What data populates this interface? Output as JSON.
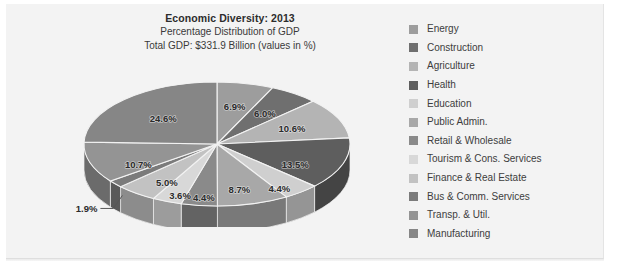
{
  "chart_data": {
    "type": "pie",
    "title": "Economic Diversity: 2013",
    "subtitle": "Percentage Distribution of GDP",
    "subtitle2": "Total GDP: $331.9 Billion (values in %)",
    "total_gdp": "$331.9 Billion",
    "year": "2013",
    "units": "%",
    "legend_position": "right",
    "grid": false,
    "categories": [
      "Energy",
      "Construction",
      "Agriculture",
      "Health",
      "Education",
      "Public Admin.",
      "Retail & Wholesale",
      "Tourism & Cons. Services",
      "Finance & Real Estate",
      "Bus & Comm. Services",
      "Transp. & Util.",
      "Manufacturing"
    ],
    "values": [
      6.9,
      6.0,
      10.6,
      13.5,
      4.4,
      8.7,
      4.4,
      3.6,
      5.0,
      1.9,
      10.7,
      24.6
    ],
    "labels": [
      "6.9%",
      "6.0%",
      "10.6%",
      "13.5%",
      "4.4%",
      "8.7%",
      "4.4%",
      "3.6%",
      "5.0%",
      "1.9%",
      "10.7%",
      "24.6%"
    ],
    "colors": [
      "#9d9d9d",
      "#6f6f6f",
      "#b4b4b4",
      "#5e5e5e",
      "#cfcfcf",
      "#a8a8a8",
      "#8a8a8a",
      "#d8d8d8",
      "#c2c2c2",
      "#7b7b7b",
      "#949494",
      "#868686"
    ],
    "callout_slice": "Bus & Comm. Services",
    "callout_label": "1.9%"
  },
  "legend": {
    "items": [
      {
        "label": "Energy",
        "color": "#9d9d9d"
      },
      {
        "label": "Construction",
        "color": "#6f6f6f"
      },
      {
        "label": "Agriculture",
        "color": "#b4b4b4"
      },
      {
        "label": "Health",
        "color": "#5e5e5e"
      },
      {
        "label": "Education",
        "color": "#cfcfcf"
      },
      {
        "label": "Public Admin.",
        "color": "#a8a8a8"
      },
      {
        "label": "Retail & Wholesale",
        "color": "#8a8a8a"
      },
      {
        "label": "Tourism & Cons. Services",
        "color": "#d8d8d8"
      },
      {
        "label": "Finance & Real Estate",
        "color": "#c2c2c2"
      },
      {
        "label": "Bus & Comm. Services",
        "color": "#7b7b7b"
      },
      {
        "label": "Transp. & Util.",
        "color": "#949494"
      },
      {
        "label": "Manufacturing",
        "color": "#868686"
      }
    ]
  },
  "panel": {
    "background": "#f3f3f3"
  }
}
